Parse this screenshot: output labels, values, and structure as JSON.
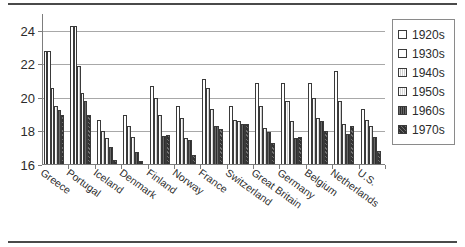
{
  "chart_data": {
    "type": "bar",
    "title": "",
    "subtitle": "",
    "xlabel": "",
    "ylabel": "",
    "ylim": [
      16,
      25
    ],
    "yticks": [
      16,
      18,
      20,
      22,
      24
    ],
    "ytick_labels": [
      "16",
      "18",
      "20",
      "22",
      "24"
    ],
    "grid": true,
    "legend_position": "right",
    "orientation": "vertical",
    "categories": [
      "Greece",
      "Portugal",
      "Iceland",
      "Denmark",
      "Finland",
      "Norway",
      "France",
      "Switzerland",
      "Great Britain",
      "Germany",
      "Belgium",
      "Netherlands",
      "U.S."
    ],
    "series": [
      {
        "name": "1920s",
        "color": "#ffffff",
        "values": [
          22.8,
          24.3,
          null,
          null,
          null,
          null,
          null,
          null,
          null,
          null,
          null,
          null,
          null
        ]
      },
      {
        "name": "1930s",
        "color": "#ffffff",
        "values": [
          22.8,
          24.3,
          18.7,
          19.0,
          20.7,
          19.5,
          21.1,
          19.5,
          20.9,
          20.9,
          20.9,
          21.6,
          19.35
        ]
      },
      {
        "name": "1940s",
        "color": "#cfcfcf",
        "values": [
          20.6,
          21.9,
          18.0,
          18.3,
          20.0,
          18.8,
          20.6,
          18.7,
          19.5,
          19.8,
          20.0,
          19.8,
          18.7
        ]
      },
      {
        "name": "1950s",
        "color": "#d6d6d6",
        "values": [
          19.5,
          20.3,
          17.6,
          17.65,
          19.0,
          17.6,
          19.35,
          18.6,
          18.2,
          18.6,
          18.8,
          18.45,
          18.35
        ]
      },
      {
        "name": "1960s",
        "color": "#2e2e2e",
        "values": [
          19.3,
          19.8,
          17.1,
          16.75,
          17.75,
          17.5,
          18.3,
          18.45,
          17.95,
          17.6,
          18.6,
          17.85,
          17.65
        ]
      },
      {
        "name": "1970s",
        "color": "#323232",
        "values": [
          19.0,
          19.0,
          16.3,
          16.25,
          17.8,
          16.6,
          18.15,
          18.45,
          17.3,
          17.65,
          18.0,
          18.35,
          16.85
        ]
      }
    ]
  },
  "legend": {
    "items": [
      {
        "label": "1920s"
      },
      {
        "label": "1930s"
      },
      {
        "label": "1940s"
      },
      {
        "label": "1950s"
      },
      {
        "label": "1960s"
      },
      {
        "label": "1970s"
      }
    ]
  }
}
